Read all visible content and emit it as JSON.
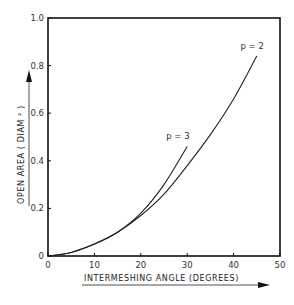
{
  "chart_data": {
    "type": "line",
    "title": "",
    "xlabel": "INTERMESHING  ANGLE  (DEGREES)",
    "ylabel": "OPEN  AREA  ( DIAM ² )",
    "xlim": [
      0,
      50
    ],
    "ylim": [
      0,
      1.0
    ],
    "x_ticks": [
      "0",
      "10",
      "20",
      "30",
      "40",
      "50"
    ],
    "y_ticks": [
      "0",
      "0.2",
      "0.4",
      "0.6",
      "0.8",
      "1.0"
    ],
    "grid": false,
    "legend": "none (inline curve annotations)",
    "series": [
      {
        "name": "p = 2",
        "x": [
          0,
          5,
          10,
          15,
          20,
          25,
          30,
          35,
          40,
          45
        ],
        "y": [
          0,
          0.015,
          0.05,
          0.1,
          0.17,
          0.26,
          0.38,
          0.51,
          0.66,
          0.84
        ]
      },
      {
        "name": "p = 3",
        "x": [
          0,
          5,
          10,
          15,
          20,
          25,
          30
        ],
        "y": [
          0,
          0.015,
          0.05,
          0.1,
          0.18,
          0.3,
          0.46
        ]
      }
    ],
    "annotations": [
      {
        "text": "p = 2",
        "x": 44,
        "y": 0.87
      },
      {
        "text": "p = 3",
        "x": 28,
        "y": 0.49
      }
    ]
  }
}
